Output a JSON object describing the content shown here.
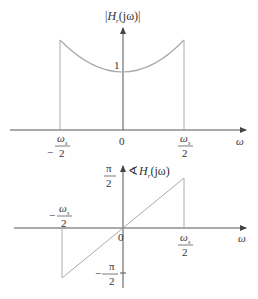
{
  "colors": {
    "axis": "#555555",
    "curve": "#aaaaaa",
    "text": "#333333"
  },
  "magnitude_plot": {
    "y_label_prefix": "|",
    "y_label_H": "H",
    "y_label_sub": "r",
    "y_label_arg": "(jω)|",
    "x_label": "ω",
    "origin_label": "0",
    "level_label": "1",
    "left_tick_num": "ω",
    "left_tick_sub": "s",
    "left_tick_den": "2",
    "left_tick_sign": "−",
    "right_tick_num": "ω",
    "right_tick_sub": "s",
    "right_tick_den": "2"
  },
  "phase_plot": {
    "y_label_angle": "∢",
    "y_label_H": "H",
    "y_label_sub": "r",
    "y_label_arg": "(jω)",
    "x_label": "ω",
    "origin_label": "0",
    "top_tick_num": "π",
    "top_tick_den": "2",
    "bottom_tick_sign": "−",
    "bottom_tick_num": "π",
    "bottom_tick_den": "2",
    "left_tick_sign": "−",
    "left_tick_num": "ω",
    "left_tick_sub": "s",
    "left_tick_den": "2",
    "right_tick_num": "ω",
    "right_tick_sub": "s",
    "right_tick_den": "2"
  }
}
